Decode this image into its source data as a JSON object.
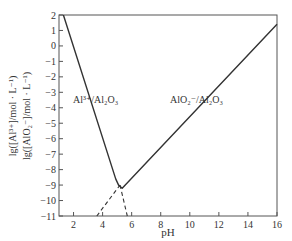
{
  "chart_data": {
    "type": "line",
    "title": "",
    "xlabel": "pH",
    "ylabel_lines": [
      "lg([Al³⁺]/mol · L⁻¹)",
      "lg([AlO₂⁻]/mol · L⁻¹)"
    ],
    "xlim": [
      1,
      16
    ],
    "ylim": [
      -11,
      2
    ],
    "xticks": [
      2,
      4,
      6,
      8,
      10,
      12,
      14,
      16
    ],
    "yticks": [
      2,
      1,
      0,
      -1,
      -2,
      -3,
      -4,
      -5,
      -6,
      -7,
      -8,
      -9,
      -10,
      -11
    ],
    "grid": false,
    "series": [
      {
        "name": "Al3+/Al2O3 + AlO2-/Al2O3 (solubility)",
        "style": "solid",
        "x": [
          1.3,
          4.9,
          5.1,
          5.35,
          16
        ],
        "y": [
          2,
          -8.6,
          -9.0,
          -9.2,
          1.4
        ]
      },
      {
        "name": "Al3+ extrapolation",
        "style": "dashed",
        "x": [
          5.2,
          5.7
        ],
        "y": [
          -9.0,
          -11
        ]
      },
      {
        "name": "AlO2- extrapolation",
        "style": "dashed",
        "x": [
          3.6,
          5.2
        ],
        "y": [
          -11,
          -9.0
        ]
      }
    ],
    "annotations": [
      {
        "text": "Al³⁺/Al₂O₃",
        "x": 3.1,
        "y": -4.3
      },
      {
        "text": "AlO₂⁻/Al₂O₃",
        "x": 10.2,
        "y": -4.3
      }
    ]
  },
  "labels": {
    "xlabel": "pH",
    "ylabel1": "lg([Al³⁺]/mol · L⁻¹)",
    "ylabel2": "lg([AlO₂⁻]/mol · L⁻¹)",
    "ann1": "Al³⁺/Al₂O₃",
    "ann2": "AlO₂⁻/Al₂O₃"
  }
}
